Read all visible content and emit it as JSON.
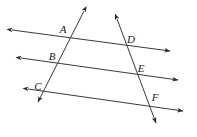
{
  "figure": {
    "type": "geometry-diagram",
    "background_color": "#ffffff",
    "line_color": "#3a3a3a",
    "label_color": "#1a1a1a",
    "width": 197,
    "height": 137,
    "labels": [
      {
        "id": "A",
        "text": "A",
        "x": 63,
        "y": 33
      },
      {
        "id": "B",
        "text": "B",
        "x": 52,
        "y": 60
      },
      {
        "id": "C",
        "text": "C",
        "x": 38,
        "y": 90
      },
      {
        "id": "D",
        "text": "D",
        "x": 131,
        "y": 43
      },
      {
        "id": "E",
        "text": "E",
        "x": 141,
        "y": 72
      },
      {
        "id": "F",
        "text": "F",
        "x": 155,
        "y": 101
      }
    ],
    "parallel_lines": [
      {
        "id": "line-top",
        "x1": 12,
        "y1": 30,
        "x2": 170,
        "y2": 51
      },
      {
        "id": "line-middle",
        "x1": 21,
        "y1": 58,
        "x2": 178,
        "y2": 80
      },
      {
        "id": "line-bottom",
        "x1": 28,
        "y1": 89,
        "x2": 183,
        "y2": 111
      }
    ],
    "transversals": [
      {
        "id": "transversal-left",
        "x1": 84,
        "y1": 11,
        "x2": 38,
        "y2": 102
      },
      {
        "id": "transversal-right",
        "x1": 117,
        "y1": 19,
        "x2": 156,
        "y2": 123
      }
    ],
    "intersections": [
      {
        "id": "A",
        "x": 69,
        "y": 38
      },
      {
        "id": "B",
        "x": 55,
        "y": 66
      },
      {
        "id": "C",
        "x": 39,
        "y": 97
      },
      {
        "id": "D",
        "x": 127,
        "y": 44
      },
      {
        "id": "E",
        "x": 137,
        "y": 72
      },
      {
        "id": "F",
        "x": 149,
        "y": 103
      }
    ]
  }
}
